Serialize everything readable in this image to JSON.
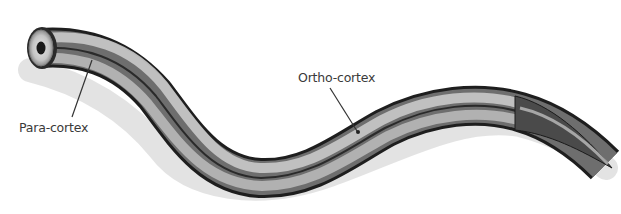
{
  "diagram": {
    "labels": [
      {
        "id": "para",
        "text": "Para-cortex"
      },
      {
        "id": "ortho",
        "text": "Ortho-cortex"
      }
    ],
    "colors": {
      "fiber_dark": "#1e1e1e",
      "fiber_mid": "#6e6e6e",
      "fiber_light": "#c8c8c8",
      "shadow": "#d8d8d8",
      "end_face": "#bdbdbd",
      "core": "#1a1a1a",
      "leader_line": "#333333",
      "label_text": "#3a3a3a"
    }
  }
}
